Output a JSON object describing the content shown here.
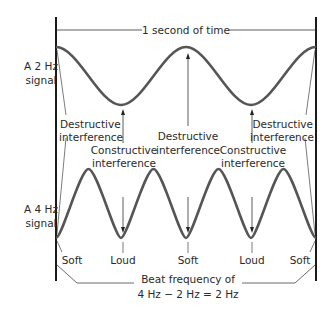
{
  "title": "1 second of time",
  "signals": {
    "top": {
      "line1": "A 2 Hz",
      "line2": "signal"
    },
    "bottom": {
      "line1": "A 4 Hz",
      "line2": "signal"
    }
  },
  "labels": {
    "destructive_left": {
      "line1": "Destructive",
      "line2": "interference"
    },
    "destructive_center": {
      "line1": "Destructive",
      "line2": "interference"
    },
    "destructive_right": {
      "line1": "Destructive",
      "line2": "interference"
    },
    "constructive_left": {
      "line1": "Constructive",
      "line2": "interference"
    },
    "constructive_right": {
      "line1": "Constructive",
      "line2": "interference"
    }
  },
  "loudness": [
    "Soft",
    "Loud",
    "Soft",
    "Loud",
    "Soft"
  ],
  "beat": {
    "line1": "Beat frequency of",
    "line2": "4 Hz − 2 Hz = 2 Hz"
  },
  "colors": {
    "wave": "#555555",
    "line": "#222222",
    "text": "#2a2a2a"
  }
}
